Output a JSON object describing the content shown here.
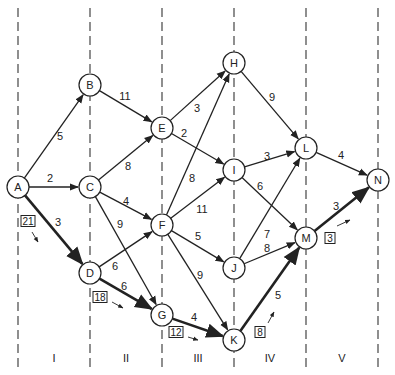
{
  "diagram": {
    "type": "network-flow-stages",
    "stages": [
      {
        "label": "I",
        "x": 54
      },
      {
        "label": "II",
        "x": 126
      },
      {
        "label": "III",
        "x": 198
      },
      {
        "label": "IV",
        "x": 270
      },
      {
        "label": "V",
        "x": 342
      }
    ],
    "stage_boundaries_x": [
      18,
      90,
      162,
      234,
      306,
      378
    ],
    "nodes": [
      {
        "id": "A",
        "x": 18,
        "y": 187
      },
      {
        "id": "B",
        "x": 90,
        "y": 85
      },
      {
        "id": "C",
        "x": 90,
        "y": 187
      },
      {
        "id": "D",
        "x": 90,
        "y": 273
      },
      {
        "id": "E",
        "x": 162,
        "y": 128
      },
      {
        "id": "F",
        "x": 162,
        "y": 225
      },
      {
        "id": "G",
        "x": 162,
        "y": 315
      },
      {
        "id": "H",
        "x": 234,
        "y": 63
      },
      {
        "id": "I",
        "x": 234,
        "y": 170
      },
      {
        "id": "J",
        "x": 234,
        "y": 268
      },
      {
        "id": "K",
        "x": 234,
        "y": 340
      },
      {
        "id": "L",
        "x": 306,
        "y": 148
      },
      {
        "id": "M",
        "x": 306,
        "y": 238
      },
      {
        "id": "N",
        "x": 378,
        "y": 180
      }
    ],
    "edges": [
      {
        "from": "A",
        "to": "B",
        "weight": "5",
        "lx": 60,
        "ly": 140,
        "bold": false
      },
      {
        "from": "A",
        "to": "C",
        "weight": "2",
        "lx": 50,
        "ly": 182,
        "bold": false
      },
      {
        "from": "A",
        "to": "D",
        "weight": "3",
        "lx": 58,
        "ly": 226,
        "bold": true
      },
      {
        "from": "B",
        "to": "E",
        "weight": "11",
        "lx": 125,
        "ly": 100,
        "bold": false
      },
      {
        "from": "C",
        "to": "E",
        "weight": "8",
        "lx": 128,
        "ly": 170,
        "bold": false
      },
      {
        "from": "C",
        "to": "F",
        "weight": "4",
        "lx": 126,
        "ly": 205,
        "bold": false
      },
      {
        "from": "C",
        "to": "G",
        "weight": "9",
        "lx": 120,
        "ly": 228,
        "bold": false
      },
      {
        "from": "D",
        "to": "F",
        "weight": "6",
        "lx": 115,
        "ly": 270,
        "bold": false
      },
      {
        "from": "D",
        "to": "G",
        "weight": "6",
        "lx": 124,
        "ly": 290,
        "bold": true
      },
      {
        "from": "E",
        "to": "H",
        "weight": "3",
        "lx": 197,
        "ly": 112,
        "bold": false
      },
      {
        "from": "E",
        "to": "I",
        "weight": "2",
        "lx": 184,
        "ly": 137,
        "bold": false
      },
      {
        "from": "F",
        "to": "H",
        "weight": "8",
        "lx": 192,
        "ly": 182,
        "bold": false
      },
      {
        "from": "F",
        "to": "I",
        "weight": "11",
        "lx": 202,
        "ly": 213,
        "bold": false
      },
      {
        "from": "F",
        "to": "J",
        "weight": "5",
        "lx": 198,
        "ly": 240,
        "bold": false
      },
      {
        "from": "F",
        "to": "K",
        "weight": "9",
        "lx": 200,
        "ly": 279,
        "bold": false
      },
      {
        "from": "G",
        "to": "K",
        "weight": "4",
        "lx": 194,
        "ly": 321,
        "bold": true
      },
      {
        "from": "H",
        "to": "L",
        "weight": "9",
        "lx": 272,
        "ly": 101,
        "bold": false
      },
      {
        "from": "I",
        "to": "L",
        "weight": "3",
        "lx": 267,
        "ly": 160,
        "bold": false
      },
      {
        "from": "I",
        "to": "M",
        "weight": "6",
        "lx": 260,
        "ly": 190,
        "bold": false
      },
      {
        "from": "J",
        "to": "L",
        "weight": "7",
        "lx": 267,
        "ly": 238,
        "bold": false
      },
      {
        "from": "J",
        "to": "M",
        "weight": "8",
        "lx": 267,
        "ly": 252,
        "bold": false
      },
      {
        "from": "K",
        "to": "M",
        "weight": "5",
        "lx": 278,
        "ly": 299,
        "bold": true
      },
      {
        "from": "L",
        "to": "N",
        "weight": "4",
        "lx": 341,
        "ly": 159,
        "bold": false
      },
      {
        "from": "M",
        "to": "N",
        "weight": "3",
        "lx": 336,
        "ly": 210,
        "bold": true
      }
    ],
    "boxed_values": [
      {
        "value": "21",
        "x": 28,
        "y": 222,
        "ax1": 32,
        "ay1": 232,
        "ax2": 38,
        "ay2": 242
      },
      {
        "value": "18",
        "x": 100,
        "y": 298,
        "ax1": 112,
        "ay1": 302,
        "ax2": 123,
        "ay2": 308
      },
      {
        "value": "12",
        "x": 176,
        "y": 333,
        "ax1": 188,
        "ay1": 337,
        "ax2": 198,
        "ay2": 340
      },
      {
        "value": "8",
        "x": 260,
        "y": 333,
        "ax1": 268,
        "ay1": 323,
        "ax2": 274,
        "ay2": 312
      },
      {
        "value": "3",
        "x": 330,
        "y": 239,
        "ax1": 337,
        "ay1": 226,
        "ax2": 350,
        "ay2": 220
      }
    ],
    "colors": {
      "line": "#222222",
      "background": "#ffffff",
      "dashed": "#333333"
    }
  }
}
